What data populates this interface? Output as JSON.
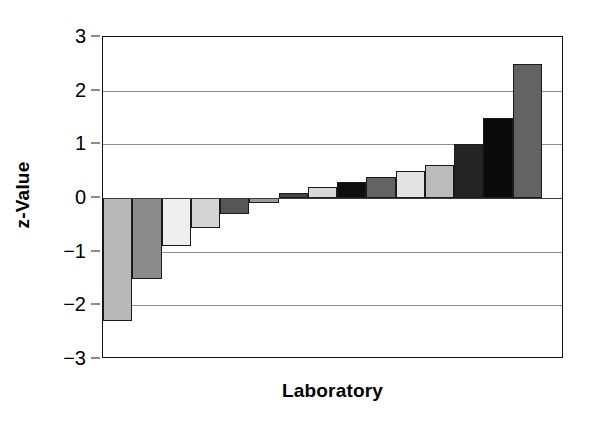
{
  "chart_data": {
    "type": "bar",
    "title": "",
    "xlabel": "Laboratory",
    "ylabel": "z-Value",
    "ylim": [
      -3,
      3
    ],
    "yticks": [
      3,
      2,
      1,
      0,
      -1,
      -2,
      -3
    ],
    "ytick_labels": [
      "3",
      "2",
      "1",
      "0",
      "−1",
      "−2",
      "−3"
    ],
    "grid": "horizontal",
    "legend": "none",
    "xtick_labels": [],
    "categories": [
      "Lab 1",
      "Lab 2",
      "Lab 3",
      "Lab 4",
      "Lab 5",
      "Lab 6",
      "Lab 7",
      "Lab 8",
      "Lab 9",
      "Lab 10",
      "Lab 11",
      "Lab 12",
      "Lab 13",
      "Lab 14",
      "Lab 15"
    ],
    "values": [
      -2.3,
      -1.5,
      -0.9,
      -0.55,
      -0.3,
      -0.1,
      0.1,
      0.2,
      0.3,
      0.4,
      0.5,
      0.62,
      1.0,
      1.5,
      2.5
    ],
    "bar_colors": [
      "#b9b9b9",
      "#8b8b8b",
      "#efefef",
      "#d4d4d4",
      "#565656",
      "#9b9b9b",
      "#464646",
      "#d8d8d8",
      "#0d0d0d",
      "#636363",
      "#e3e3e3",
      "#bcbcbc",
      "#242424",
      "#0a0a0a",
      "#636363"
    ],
    "bar_edge_color": "#1b1b1b",
    "gridline_color": "#8d8d8d",
    "axis_color": "#111111",
    "background_color": "#ffffff"
  }
}
